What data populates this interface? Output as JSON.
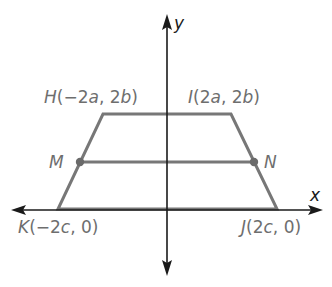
{
  "diagram": {
    "type": "coordinate-plane-trapezoid",
    "colors": {
      "axis": "#1a1a1a",
      "shape": "#777777",
      "label": "#6e6e6e",
      "background": "#ffffff"
    },
    "axes": {
      "x_label": "x",
      "y_label": "y"
    },
    "vertices": [
      {
        "id": "H",
        "name": "H",
        "coords": "(−2a, 2b)",
        "x_expr": "−2a",
        "y_expr": "2b",
        "px": [
          103,
          114
        ]
      },
      {
        "id": "I",
        "name": "I",
        "coords": "(2a, 2b)",
        "x_expr": "2a",
        "y_expr": "2b",
        "px": [
          231,
          114
        ]
      },
      {
        "id": "J",
        "name": "J",
        "coords": "(2c, 0)",
        "x_expr": "2c",
        "y_expr": "0",
        "px": [
          277,
          209
        ]
      },
      {
        "id": "K",
        "name": "K",
        "coords": "(−2c, 0)",
        "x_expr": "−2c",
        "y_expr": "0",
        "px": [
          58,
          209
        ]
      }
    ],
    "midpoints": [
      {
        "id": "M",
        "name": "M",
        "segment": "HK",
        "px": [
          80,
          162
        ]
      },
      {
        "id": "N",
        "name": "N",
        "segment": "IJ",
        "px": [
          254,
          162
        ]
      }
    ],
    "labels": {
      "H": {
        "letter": "H",
        "open": "(",
        "x_coef": "−2",
        "x_var": "a",
        "sep": ", ",
        "y_coef": "2",
        "y_var": "b",
        "close": ")"
      },
      "I": {
        "letter": "I",
        "open": "(",
        "x_coef": "2",
        "x_var": "a",
        "sep": ", ",
        "y_coef": "2",
        "y_var": "b",
        "close": ")"
      },
      "J": {
        "letter": "J",
        "open": "(",
        "x_coef": "2",
        "x_var": "c",
        "sep": ", ",
        "y_val": "0",
        "close": ")"
      },
      "K": {
        "letter": "K",
        "open": "(",
        "x_coef": "−2",
        "x_var": "c",
        "sep": ", ",
        "y_val": "0",
        "close": ")"
      },
      "M": "M",
      "N": "N"
    }
  }
}
